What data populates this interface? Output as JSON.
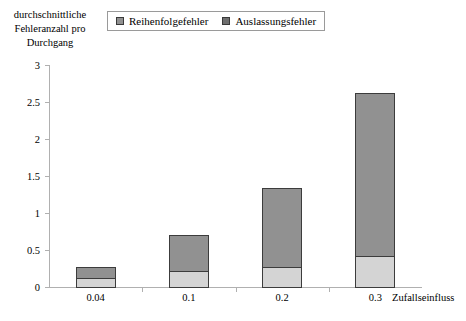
{
  "chart_data": {
    "type": "bar",
    "subtype": "stacked-bar",
    "title": "",
    "categories": [
      "0.04",
      "0.1",
      "0.2",
      "0.3"
    ],
    "series": [
      {
        "name": "Auslassungsfehler",
        "values": [
          0.14,
          0.23,
          0.28,
          0.43
        ],
        "color": "#d4d4d4"
      },
      {
        "name": "Reihenfolgefehler",
        "values": [
          0.16,
          0.5,
          1.09,
          2.22
        ],
        "color": "#919191"
      }
    ],
    "totals": [
      0.3,
      0.73,
      1.37,
      2.65
    ],
    "xlabel": "Zufallseinfluss",
    "ylabel": "durchschnittliche\nFehleranzahl pro\nDurchgang",
    "ylim": [
      0,
      3
    ],
    "yticks": [
      "0",
      "0.5",
      "1",
      "1.5",
      "2",
      "2.5",
      "3"
    ],
    "ytick_values": [
      0,
      0.5,
      1,
      1.5,
      2,
      2.5,
      3
    ],
    "grid": false,
    "legend_position": "top",
    "stack_order_bottom_to_top": [
      "Auslassungsfehler",
      "Reihenfolgefehler"
    ]
  },
  "legend": {
    "items": [
      {
        "label": "Reihenfolgefehler",
        "swatch": "#919191",
        "icon": "legend-swatch-icon"
      },
      {
        "label": "Auslassungsfehler",
        "swatch": "#6f6f6f",
        "icon": "legend-swatch-icon"
      }
    ]
  },
  "axes": {
    "y_title": "durchschnittliche\nFehleranzahl pro\nDurchgang",
    "x_title": "Zufallseinfluss"
  },
  "colors": {
    "bar_light": "#d4d4d4",
    "bar_dark": "#919191",
    "bar_border": "#3c3c3c",
    "axis": "#b0b0b0",
    "text": "#000000",
    "legend_border": "#9a9a9a"
  }
}
